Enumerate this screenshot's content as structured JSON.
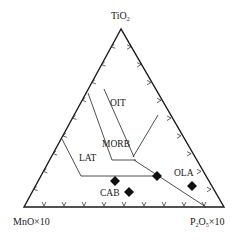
{
  "diagram": {
    "type": "ternary",
    "apices": {
      "top": {
        "label": "TiO",
        "sub": "2",
        "suffix": ""
      },
      "left": {
        "label": "MnO×10"
      },
      "right": {
        "label": "P",
        "sub1": "2",
        "mid": "O",
        "sub2": "5",
        "suffix": "×10"
      }
    },
    "fields": [
      {
        "name": "OIT",
        "label": "OIT"
      },
      {
        "name": "MORB",
        "label": "MORB"
      },
      {
        "name": "LAT",
        "label": "LAT"
      },
      {
        "name": "OLA",
        "label": "OLA"
      },
      {
        "name": "CAB",
        "label": "CAB"
      }
    ],
    "ticks_per_edge": 9,
    "line_color": "#1a1a1a",
    "data_points": [
      {
        "x": 115,
        "y": 181,
        "marker": "diamond"
      },
      {
        "x": 129,
        "y": 192,
        "marker": "diamond"
      },
      {
        "x": 157,
        "y": 176,
        "marker": "diamond"
      },
      {
        "x": 192,
        "y": 186,
        "marker": "diamond"
      }
    ]
  }
}
